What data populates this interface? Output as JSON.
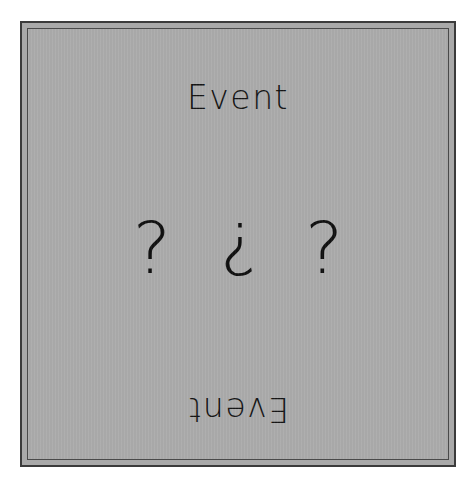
{
  "card": {
    "title_top": "Event",
    "title_bottom": "Event",
    "background_color": "#ababab",
    "border_color": "#3b3b3b",
    "inner_border_color": "#4a4a4a",
    "text_color": "#141414",
    "page_background": "#ffffff"
  },
  "glyphs": [
    {
      "char": "?",
      "name": "question-mark-left",
      "orientation": "upright"
    },
    {
      "char": "?",
      "name": "question-mark-center-inverted",
      "orientation": "rotated-180"
    },
    {
      "char": "?",
      "name": "question-mark-right",
      "orientation": "upright"
    }
  ]
}
